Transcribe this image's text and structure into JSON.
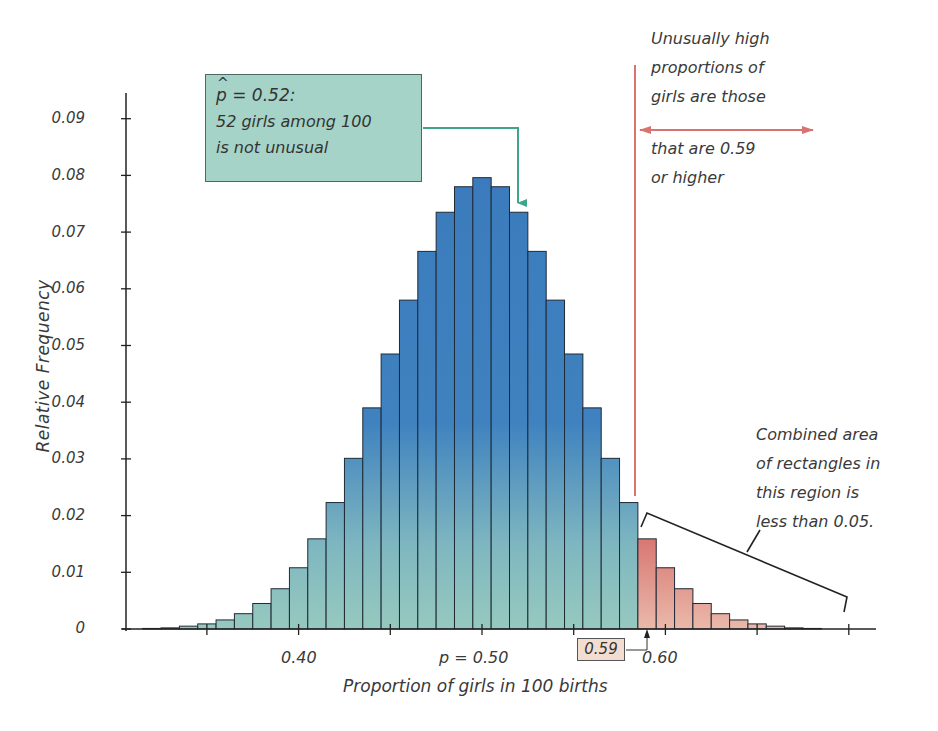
{
  "chart_data": {
    "type": "bar",
    "title": "",
    "xlabel": "Proportion of girls in 100 births",
    "ylabel": "Relative Frequency",
    "ylim": [
      0,
      0.09
    ],
    "xlim": [
      0.31,
      0.72
    ],
    "x_ticks": [
      {
        "value": 0.35,
        "label": ""
      },
      {
        "value": 0.4,
        "label": "0.40"
      },
      {
        "value": 0.45,
        "label": ""
      },
      {
        "value": 0.5,
        "label": "p = 0.50"
      },
      {
        "value": 0.55,
        "label": ""
      },
      {
        "value": 0.6,
        "label": "0.60"
      },
      {
        "value": 0.65,
        "label": ""
      },
      {
        "value": 0.7,
        "label": ""
      }
    ],
    "y_ticks": [
      "0",
      "0.01",
      "0.02",
      "0.03",
      "0.04",
      "0.05",
      "0.06",
      "0.07",
      "0.08",
      "0.09"
    ],
    "grid": false,
    "categories": [
      0.32,
      0.33,
      0.34,
      0.35,
      0.36,
      0.37,
      0.38,
      0.39,
      0.4,
      0.41,
      0.42,
      0.43,
      0.44,
      0.45,
      0.46,
      0.47,
      0.48,
      0.49,
      0.5,
      0.51,
      0.52,
      0.53,
      0.54,
      0.55,
      0.56,
      0.57,
      0.58,
      0.59,
      0.6,
      0.61,
      0.62,
      0.63,
      0.64,
      0.65,
      0.66,
      0.67,
      0.68
    ],
    "values": [
      0.0001,
      0.0002,
      0.0005,
      0.0009,
      0.0016,
      0.0027,
      0.0045,
      0.0071,
      0.0108,
      0.0159,
      0.0223,
      0.0301,
      0.039,
      0.0485,
      0.058,
      0.0666,
      0.0735,
      0.078,
      0.0796,
      0.078,
      0.0735,
      0.0666,
      0.058,
      0.0485,
      0.039,
      0.0301,
      0.0223,
      0.0159,
      0.0108,
      0.0071,
      0.0045,
      0.0027,
      0.0016,
      0.0009,
      0.0005,
      0.0002,
      0.0001
    ],
    "highlight_threshold": 0.59,
    "colors": {
      "normal_top": "#3b7bbd",
      "normal_bottom": "#96c9be",
      "tail_top": "#d6716d",
      "tail_bottom": "#eab9aa",
      "bar_edge": "#1f2a36",
      "threshold_line": "#d9736f",
      "callout_fill": "#a6d3c7",
      "callout_arrow": "#3fa58a"
    },
    "annotations": [
      {
        "text": "p̂ = 0.52: 52 girls among 100 is not unusual",
        "points_to": 0.52
      },
      {
        "text": "Unusually high proportions of girls are those that are 0.59 or higher",
        "at": 0.59
      },
      {
        "text": "Combined area of rectangles in this region is less than 0.05.",
        "region": [
          0.59,
          0.7
        ]
      }
    ]
  },
  "labels": {
    "ylabel": "Relative Frequency",
    "xlabel": "Proportion of girls in 100 births",
    "xtick_040": "0.40",
    "xtick_050": "p = 0.50",
    "xtick_060": "0.60",
    "threshold_box": "0.59",
    "yticks": {
      "t0": "0",
      "t1": "0.01",
      "t2": "0.02",
      "t3": "0.03",
      "t4": "0.04",
      "t5": "0.05",
      "t6": "0.06",
      "t7": "0.07",
      "t8": "0.08",
      "t9": "0.09"
    }
  },
  "callout": {
    "phat_symbol": "p",
    "line1_rest": " = 0.52:",
    "line2": "52 girls among 100",
    "line3": "is not unusual"
  },
  "note_high": {
    "lines": [
      "Unusually high",
      "proportions of",
      "girls are those"
    ],
    "lines_below": [
      "that are 0.59",
      "or higher"
    ]
  },
  "note_area": {
    "lines": [
      "Combined area",
      "of rectangles in",
      "this region is",
      "less than 0.05."
    ]
  }
}
